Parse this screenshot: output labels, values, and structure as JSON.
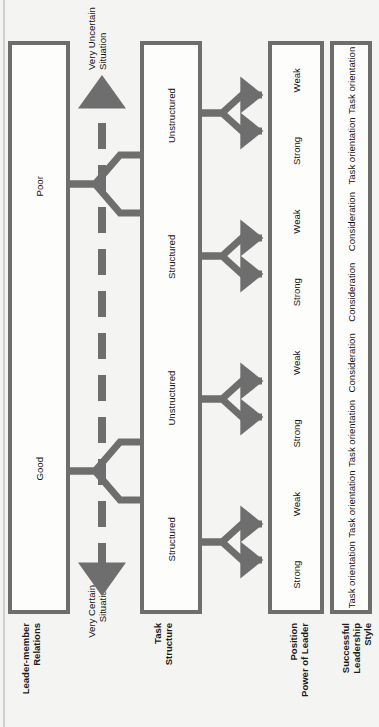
{
  "diagram": {
    "orientation": "rotated-90",
    "colors": {
      "page_background": "#f4f4f2",
      "box_fill": "#fdfdfc",
      "stroke": "#6e6e6e",
      "text": "#141414"
    },
    "rows": [
      {
        "id": "leader-member-relations",
        "label": "Leader-member\nRelations",
        "label_lines": [
          "Leader-member",
          "Relations"
        ],
        "cells": [
          "Good",
          "Poor"
        ]
      },
      {
        "id": "task-structure",
        "label": "Task\nStructure",
        "label_lines": [
          "Task",
          "Structure"
        ],
        "cells": [
          "Structured",
          "Unstructured",
          "Structured",
          "Unstructured"
        ]
      },
      {
        "id": "position-power-of-leader",
        "label": "Position\nPower of Leader",
        "label_lines": [
          "Position",
          "Power of Leader"
        ],
        "cells": [
          "Strong",
          "Weak",
          "Strong",
          "Weak",
          "Strong",
          "Weak",
          "Strong",
          "Weak"
        ]
      },
      {
        "id": "successful-leadership-style",
        "label": "Successful\nLeadership\nStyle",
        "label_lines": [
          "Successful",
          "Leadership",
          "Style"
        ],
        "cells": [
          "Task orientation",
          "Task orientation",
          "Task orientation",
          "Consideration",
          "Consideration",
          "Consideration",
          "Task orientation",
          "Task orientation"
        ]
      }
    ],
    "continuum": {
      "left_label_lines": [
        "Very Certain",
        "Situation"
      ],
      "right_label_lines": [
        "Very Uncertain",
        "Situation"
      ],
      "left_label": "Very Certain Situation",
      "right_label": "Very Uncertain Situation",
      "style": "double-headed dashed arrow"
    }
  }
}
